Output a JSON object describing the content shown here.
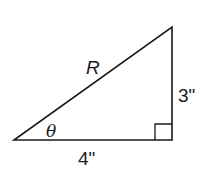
{
  "diagram": {
    "type": "right-triangle",
    "labels": {
      "hypotenuse": "R",
      "opposite": "3\"",
      "adjacent": "4\"",
      "angle": "θ"
    },
    "right_angle_marker": true,
    "colors": {
      "stroke": "#1a1a1a",
      "background": "#ffffff"
    }
  }
}
